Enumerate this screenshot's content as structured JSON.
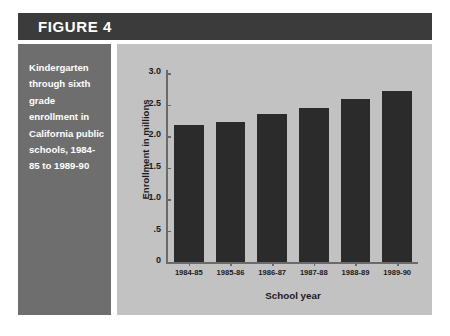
{
  "figure": {
    "header_label": "FIGURE 4",
    "caption": "Kindergarten through sixth grade enrollment in California public schools, 1984-85 to 1989-90",
    "colors": {
      "header_bar": "#3b3b3b",
      "caption_panel": "#6e6e6e",
      "chart_panel": "#c2c2c2",
      "bar_fill": "#2b2b2b",
      "axis_line": "#6a6a6a",
      "caption_text": "#ffffff",
      "axis_text": "#1a1a1a"
    }
  },
  "chart_data": {
    "type": "bar",
    "title": "",
    "xlabel": "School year",
    "ylabel": "Enrollment in millions",
    "categories": [
      "1984-85",
      "1985-86",
      "1986-87",
      "1987-88",
      "1988-89",
      "1989-90"
    ],
    "values": [
      2.17,
      2.22,
      2.35,
      2.45,
      2.58,
      2.72
    ],
    "ylim": [
      0,
      3.0
    ],
    "yticks": [
      0,
      0.5,
      1.0,
      1.5,
      2.0,
      2.5,
      3.0
    ],
    "ytick_labels": [
      "0",
      ".5",
      "1.0",
      "1.5",
      "2.0",
      "2.5",
      "3.0"
    ],
    "grid": false,
    "legend": null
  }
}
